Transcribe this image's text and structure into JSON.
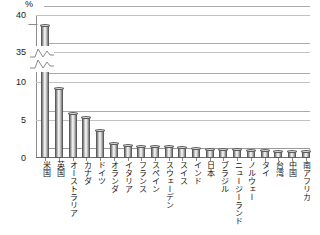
{
  "chart_data": {
    "type": "bar",
    "title": "",
    "subtitle": "",
    "xlabel": "",
    "ylabel": "%",
    "unit": "%",
    "grid": true,
    "legend": false,
    "legend_position": "none",
    "axis_break": {
      "present": true,
      "lower_segment": [
        0,
        11
      ],
      "upper_segment": [
        34,
        40
      ],
      "note": "y-axis broken between 10 and 35"
    },
    "yticks": [
      "0",
      "5",
      "10",
      "35",
      "40"
    ],
    "ytick_values": [
      0,
      5,
      10,
      35,
      40
    ],
    "ylim": [
      0,
      40
    ],
    "categories": [
      "米国",
      "英国",
      "オーストラリア",
      "カナダ",
      "ドイツ",
      "オランダ",
      "イタリア",
      "フランス",
      "スペイン",
      "スウェーデン",
      "スイス",
      "インド",
      "日本",
      "ブラジル",
      "ニュージーランド",
      "ノルウェー",
      "タイ",
      "台湾",
      "中国",
      "南アフリカ"
    ],
    "values": [
      38.5,
      9.1,
      5.7,
      5.3,
      3.6,
      1.9,
      1.6,
      1.5,
      1.4,
      1.4,
      1.3,
      1.2,
      1.1,
      1.0,
      1.0,
      0.9,
      0.9,
      0.8,
      0.8,
      0.8
    ]
  },
  "colors": {
    "bar_fill_light": "#f6f6f6",
    "bar_fill_dark": "#6f6f6f",
    "bar_outline": "#5c5c5c",
    "gridline": "#aaaaaa",
    "axis": "#8a8a8a",
    "text": "#1a1a1a",
    "background": "#ffffff"
  }
}
